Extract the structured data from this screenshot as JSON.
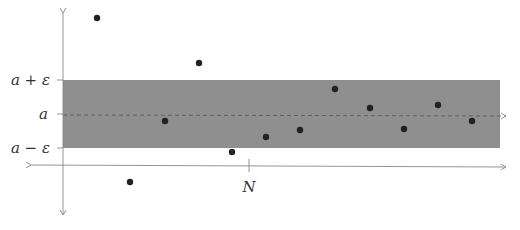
{
  "figure": {
    "band_color": "#8f8f8f",
    "axis_color": "#888888",
    "point_color": "#222222",
    "labels": {
      "upper": "a + ε",
      "middle": "a",
      "lower": "a − ε",
      "tick": "N"
    }
  },
  "chart_data": {
    "type": "scatter",
    "title": "",
    "xlabel": "",
    "ylabel": "",
    "y_ticks": [
      "a − ε",
      "a",
      "a + ε"
    ],
    "x_ticks": [
      "N"
    ],
    "band": {
      "lower": "a − ε",
      "upper": "a + ε",
      "fill": "#8f8f8f"
    },
    "reference_line": {
      "value": "a",
      "style": "dashed"
    },
    "points_px": [
      {
        "x": 97,
        "y": 18
      },
      {
        "x": 130,
        "y": 182
      },
      {
        "x": 165,
        "y": 121
      },
      {
        "x": 199,
        "y": 63
      },
      {
        "x": 232,
        "y": 152
      },
      {
        "x": 266,
        "y": 137
      },
      {
        "x": 300,
        "y": 130
      },
      {
        "x": 335,
        "y": 89
      },
      {
        "x": 370,
        "y": 108
      },
      {
        "x": 404,
        "y": 129
      },
      {
        "x": 438,
        "y": 105
      },
      {
        "x": 472,
        "y": 121
      }
    ],
    "series": [
      {
        "name": "sequence a_n",
        "values_relative_to_a_in_eps": [
          2.9,
          -2.0,
          -0.2,
          1.5,
          -1.1,
          -0.7,
          -0.5,
          0.8,
          0.2,
          -0.5,
          0.3,
          -0.2
        ]
      }
    ],
    "grid": false,
    "legend": null
  }
}
